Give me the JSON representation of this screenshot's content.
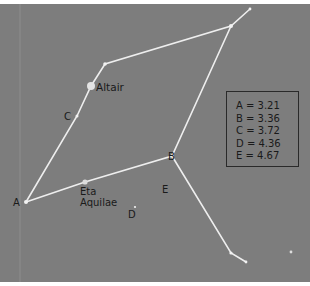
{
  "diagram": {
    "type": "star-chart",
    "constellation_stars": {
      "named": [
        {
          "id": "altair",
          "label": "Altair"
        },
        {
          "id": "eta-aquilae",
          "label_line1": "Eta",
          "label_line2": "Aquilae"
        }
      ],
      "lettered": [
        {
          "id": "A",
          "label": "A"
        },
        {
          "id": "B",
          "label": "B"
        },
        {
          "id": "C",
          "label": "C"
        },
        {
          "id": "D",
          "label": "D"
        },
        {
          "id": "E",
          "label": "E"
        }
      ]
    },
    "legend": {
      "rows": [
        {
          "letter": "A",
          "text": "A = 3.21"
        },
        {
          "letter": "B",
          "text": "B = 3.36"
        },
        {
          "letter": "C",
          "text": "C = 3.72"
        },
        {
          "letter": "D",
          "text": "D = 4.36"
        },
        {
          "letter": "E",
          "text": "E = 4.67"
        }
      ]
    },
    "colors": {
      "sky": "#7d7d7d",
      "lines": "#e8e8e8",
      "text": "#1a1a1a",
      "legend_border": "#2a2a2a"
    }
  }
}
